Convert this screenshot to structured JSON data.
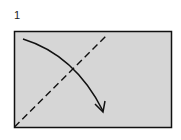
{
  "diagram": {
    "step_label": "1",
    "paper_color": "#d6d6d6",
    "line_color": "#111111",
    "elements": {
      "paper": "rectangle sheet",
      "fold_line": "dashed diagonal valley fold from bottom-left corner toward top edge",
      "fold_arrow": "curved arrow from top-left corner down to the right"
    }
  }
}
